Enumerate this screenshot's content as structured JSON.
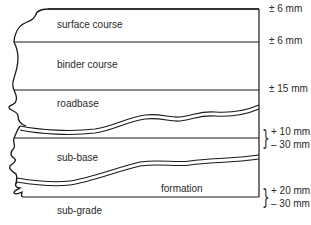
{
  "diagram": {
    "layers": [
      {
        "name": "surface course"
      },
      {
        "name": "binder course"
      },
      {
        "name": "roadbase"
      },
      {
        "name": "sub-base"
      },
      {
        "name": "formation"
      },
      {
        "name": "sub-grade"
      }
    ],
    "tolerances": [
      {
        "boundary": "top of surface course",
        "value": "± 6 mm"
      },
      {
        "boundary": "surface/binder interface",
        "value": "± 6 mm"
      },
      {
        "boundary": "binder/roadbase interface",
        "value": "± 15 mm"
      },
      {
        "boundary": "top of sub-base",
        "upper": "+ 10 mm",
        "lower": "– 30 mm"
      },
      {
        "boundary": "formation level",
        "upper": "+ 20 mm",
        "lower": "– 30 mm"
      }
    ],
    "colors": {
      "line": "#1a1a1a",
      "text": "#2a2a2a",
      "background": "#ffffff"
    }
  }
}
